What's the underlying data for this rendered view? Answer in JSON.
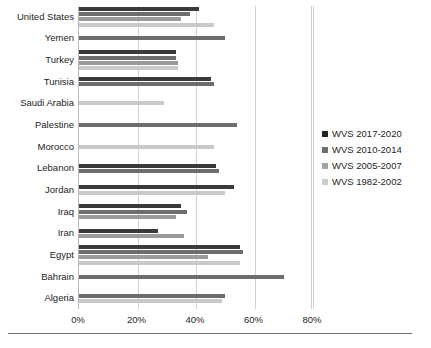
{
  "chart_data": {
    "type": "bar",
    "orientation": "horizontal",
    "title": "",
    "xlabel": "",
    "ylabel": "",
    "xlim": [
      0,
      80
    ],
    "xticks": [
      "0%",
      "20%",
      "40%",
      "60%",
      "80%"
    ],
    "xtick_values": [
      0,
      20,
      40,
      60,
      80
    ],
    "grid": true,
    "grid_axis": "x",
    "legend_position": "right",
    "value_unit": "%",
    "categories": [
      "United States",
      "Yemen",
      "Turkey",
      "Tunisia",
      "Saudi Arabia",
      "Palestine",
      "Morocco",
      "Lebanon",
      "Jordan",
      "Iraq",
      "Iran",
      "Egypt",
      "Bahrain",
      "Algeria"
    ],
    "series": [
      {
        "name": "WVS 2017-2020",
        "color": "#3a3a3a",
        "values": [
          41,
          null,
          33,
          45,
          null,
          null,
          null,
          47,
          53,
          35,
          27,
          55,
          null,
          null
        ]
      },
      {
        "name": "WVS 2010-2014",
        "color": "#6d6d6d",
        "values": [
          38,
          50,
          33,
          46,
          null,
          54,
          null,
          48,
          null,
          37,
          null,
          56,
          70,
          50
        ]
      },
      {
        "name": "WVS 2005-2007",
        "color": "#9a9a9a",
        "values": [
          35,
          null,
          34,
          null,
          null,
          null,
          null,
          null,
          null,
          33,
          36,
          44,
          null,
          null
        ]
      },
      {
        "name": "WVS 1982-2002",
        "color": "#c9c9c9",
        "values": [
          46,
          null,
          34,
          null,
          29,
          null,
          46,
          null,
          50,
          null,
          null,
          55,
          null,
          49
        ]
      }
    ]
  },
  "legend": {
    "items": [
      {
        "label": "WVS 2017-2020"
      },
      {
        "label": "WVS 2010-2014"
      },
      {
        "label": "WVS 2005-2007"
      },
      {
        "label": "WVS 1982-2002"
      }
    ]
  }
}
